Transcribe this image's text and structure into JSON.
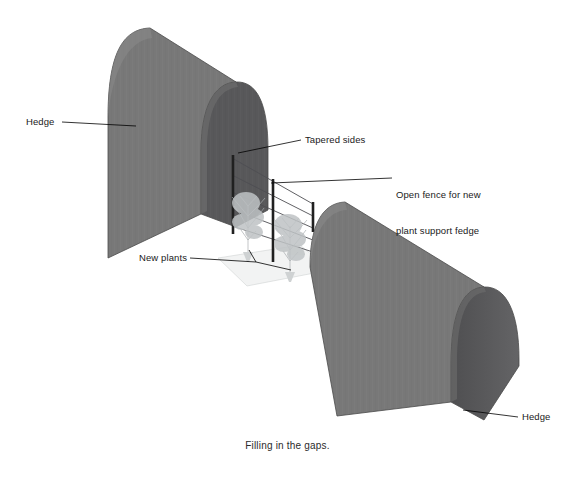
{
  "figure": {
    "caption": "Filling in the gaps.",
    "title": "Filling in the gaps."
  },
  "colors": {
    "background": "#ffffff",
    "hedge_side_face": "#787878",
    "hedge_end_face": "#58585a",
    "hedge_outline": "#4a4a4a",
    "leader_line": "#000000",
    "label_text": "#1a1a1a",
    "fence_post": "#2a2a2a",
    "fence_wire": "#55555a",
    "plant_foliage": "#b9bcbe",
    "ground_shadow": "#d9dcdd"
  },
  "labels": [
    {
      "id": "hedge-left",
      "text": "Hedge",
      "target": "left hedge near side face"
    },
    {
      "id": "tapered-sides",
      "text": "Tapered sides",
      "target": "rounded tapered end of left hedge"
    },
    {
      "id": "open-fence",
      "text": "Open fence for new\nplant support fedge",
      "line1": "Open fence for new",
      "line2": "plant support fedge",
      "target": "post and wire fence in the gap"
    },
    {
      "id": "new-plants",
      "text": "New plants",
      "target": "two young plants at the fence base"
    },
    {
      "id": "hedge-right",
      "text": "Hedge",
      "target": "right hedge rounded end face"
    }
  ],
  "scene": {
    "objects": [
      {
        "name": "hedge-left",
        "kind": "hedge-block",
        "description": "large hedge block, upper left, rounded crown, tapered sides, cut end facing the gap"
      },
      {
        "name": "fence",
        "kind": "post-and-wire-fence",
        "posts": 3,
        "wires": 5,
        "description": "open fence spanning the gap between the two hedges"
      },
      {
        "name": "new-plants",
        "kind": "plants",
        "count": 2,
        "description": "two young climbing plants trained on the fence"
      },
      {
        "name": "hedge-right",
        "kind": "hedge-block",
        "description": "second hedge block, lower right, rounded crown and tapered end"
      }
    ]
  }
}
